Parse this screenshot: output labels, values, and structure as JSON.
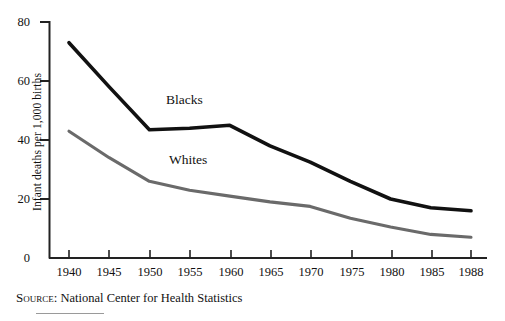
{
  "chart_data": {
    "type": "line",
    "title": "",
    "xlabel": "",
    "ylabel": "Infant deaths per 1,000 births",
    "x": [
      1940,
      1945,
      1950,
      1955,
      1960,
      1965,
      1970,
      1975,
      1980,
      1985,
      1988
    ],
    "xlim": [
      1938,
      1989
    ],
    "ylim": [
      0,
      80
    ],
    "yticks": [
      0,
      20,
      40,
      60,
      80
    ],
    "xticks": [
      "1940",
      "1945",
      "1950",
      "1955",
      "1960",
      "1965",
      "1970",
      "1975",
      "1980",
      "1985",
      "1988"
    ],
    "grid": false,
    "legend": "inline-labels",
    "series": [
      {
        "name": "Blacks",
        "color": "#111111",
        "label_position": "above-line",
        "values": [
          73,
          58,
          43.5,
          44,
          45,
          38,
          32.5,
          26,
          20,
          17,
          16
        ]
      },
      {
        "name": "Whites",
        "color": "#6a6a6a",
        "label_position": "above-line",
        "values": [
          43,
          34,
          26,
          23,
          21,
          19,
          17.5,
          13.5,
          10.5,
          8,
          7
        ]
      }
    ],
    "annotations": [
      {
        "text": "Blacks",
        "x": 1955,
        "y": 55
      },
      {
        "text": "Whites",
        "x": 1955,
        "y": 33
      }
    ]
  },
  "axis": {
    "y_title": "Infant deaths per 1,000 births",
    "y_tick_labels": [
      "80",
      "60",
      "40",
      "20",
      "0"
    ],
    "x_tick_labels": [
      "1940",
      "1945",
      "1950",
      "1955",
      "1960",
      "1965",
      "1970",
      "1975",
      "1980",
      "1985",
      "1988"
    ]
  },
  "series_labels": {
    "blacks": "Blacks",
    "whites": "Whites"
  },
  "source": {
    "kicker": "Source:",
    "text": " National Center for Health Statistics"
  },
  "colors": {
    "blacks_line": "#111111",
    "whites_line": "#6a6a6a",
    "axis": "#222222",
    "background": "#ffffff"
  }
}
